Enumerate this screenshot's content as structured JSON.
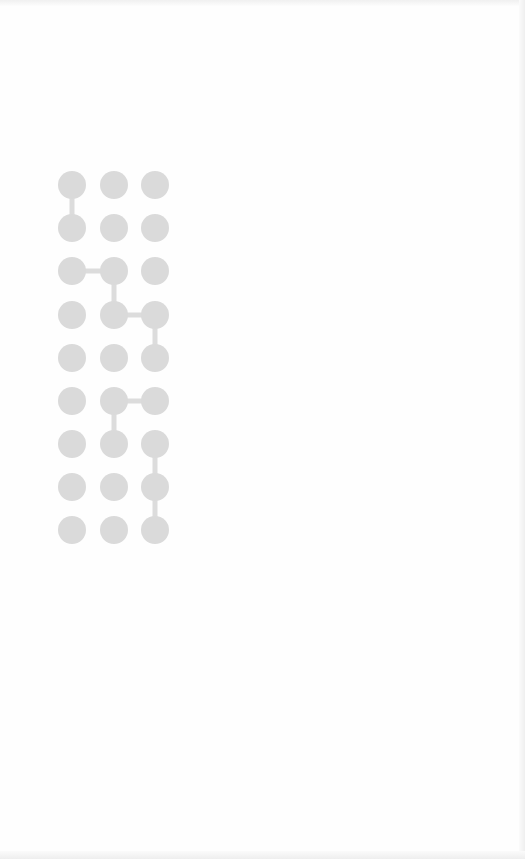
{
  "diagram": {
    "type": "grid-lattice-path",
    "columns": 3,
    "rows": 9,
    "node_color": "#dadada",
    "edge_color": "#dcdcdc",
    "background_color": "#fefefe",
    "column_x": [
      72,
      114,
      155
    ],
    "row_y": [
      185,
      228,
      271,
      315,
      358,
      401,
      444,
      487,
      530
    ],
    "node_radius": 14,
    "edges": [
      {
        "from": [
          0,
          0
        ],
        "to": [
          0,
          1
        ]
      },
      {
        "from": [
          0,
          2
        ],
        "to": [
          1,
          2
        ]
      },
      {
        "from": [
          1,
          2
        ],
        "to": [
          1,
          3
        ]
      },
      {
        "from": [
          1,
          3
        ],
        "to": [
          2,
          3
        ]
      },
      {
        "from": [
          2,
          3
        ],
        "to": [
          2,
          4
        ]
      },
      {
        "from": [
          1,
          5
        ],
        "to": [
          2,
          5
        ]
      },
      {
        "from": [
          1,
          5
        ],
        "to": [
          1,
          6
        ]
      },
      {
        "from": [
          2,
          6
        ],
        "to": [
          2,
          7
        ]
      },
      {
        "from": [
          2,
          7
        ],
        "to": [
          2,
          8
        ]
      }
    ]
  }
}
